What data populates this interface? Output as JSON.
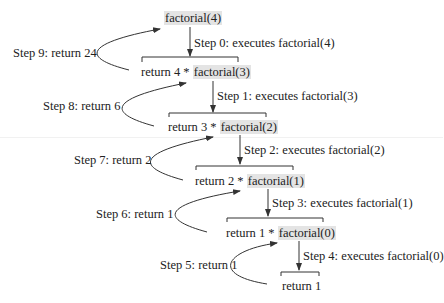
{
  "diagram": {
    "title_call": "factorial(4)",
    "levels": [
      {
        "prefix": "return 4 * ",
        "call": "factorial(3)",
        "step_down": "Step 0: executes factorial(4)",
        "step_up": "Step 9: return 24"
      },
      {
        "prefix": "return 3 * ",
        "call": "factorial(2)",
        "step_down": "Step 1: executes factorial(3)",
        "step_up": "Step 8: return 6"
      },
      {
        "prefix": "return 2 * ",
        "call": "factorial(1)",
        "step_down": "Step 2: executes factorial(2)",
        "step_up": "Step 7: return 2"
      },
      {
        "prefix": "return 1 * ",
        "call": "factorial(0)",
        "step_down": "Step 3: executes factorial(1)",
        "step_up": "Step 6: return 1"
      }
    ],
    "base": {
      "text": "return 1",
      "step_down": "Step 4: executes factorial(0)",
      "step_up": "Step 5: return 1"
    },
    "colors": {
      "line": "#333333",
      "highlight": "#e4e4e4",
      "text": "#222222"
    }
  }
}
